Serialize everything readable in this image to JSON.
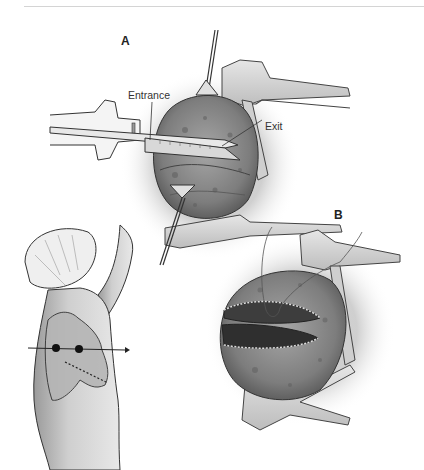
{
  "figure": {
    "panels": [
      {
        "id": "A",
        "label": "A"
      },
      {
        "id": "B",
        "label": "B"
      }
    ],
    "callouts": {
      "entrance": "Entrance",
      "exit": "Exit"
    },
    "colors": {
      "tissue": "#8a8a8a",
      "tissue_dark": "#4a4a4a",
      "retractor": "#d9d9d9",
      "outline": "#333333",
      "background": "#ffffff"
    }
  }
}
